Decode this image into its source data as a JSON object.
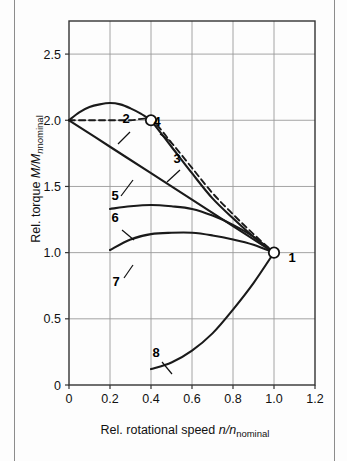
{
  "figure": {
    "background": "#fdfdfd",
    "border_color": "#8c8c8c"
  },
  "axes": {
    "x": {
      "label_prefix": "Rel. rotational speed ",
      "label_symbol": "n/n",
      "label_subscript": "nominal",
      "ticks": [
        "0",
        "0.2",
        "0.4",
        "0.6",
        "0.8",
        "1.0",
        "1.2"
      ],
      "tick_values": [
        0,
        0.2,
        0.4,
        0.6,
        0.8,
        1.0,
        1.2
      ],
      "range": [
        0,
        1.2
      ]
    },
    "y": {
      "label_prefix": "Rel. torque ",
      "label_symbol": "M/M",
      "label_sub_italic": "n",
      "label_subscript": "nominal",
      "ticks": [
        "0",
        "0.5",
        "1.0",
        "1.5",
        "2.0",
        "2.5"
      ],
      "tick_values": [
        0,
        0.5,
        1.0,
        1.5,
        2.0,
        2.5
      ],
      "range": [
        0,
        2.75
      ]
    }
  },
  "curve_labels": [
    {
      "id": "1",
      "text": "1",
      "x": 292,
      "y": 262
    },
    {
      "id": "2",
      "text": "2",
      "x": 126,
      "y": 123
    },
    {
      "id": "3",
      "text": "3",
      "x": 177,
      "y": 163
    },
    {
      "id": "4",
      "text": "4",
      "x": 157,
      "y": 126
    },
    {
      "id": "5",
      "text": "5",
      "x": 115,
      "y": 200
    },
    {
      "id": "6",
      "text": "6",
      "x": 115,
      "y": 222
    },
    {
      "id": "7",
      "text": "7",
      "x": 116,
      "y": 286
    },
    {
      "id": "8",
      "text": "8",
      "x": 156,
      "y": 357
    }
  ],
  "markers": [
    {
      "name": "point-1",
      "x": 1.0,
      "y": 1.0,
      "style": "open-circle"
    },
    {
      "name": "point-4",
      "x": 0.4,
      "y": 2.0,
      "style": "open-circle"
    }
  ],
  "chart_data": {
    "type": "line",
    "title": "",
    "xlabel": "Rel. rotational speed n/n_nominal",
    "ylabel": "Rel. torque M/M_n nominal",
    "xlim": [
      0,
      1.2
    ],
    "ylim": [
      0,
      2.75
    ],
    "grid": true,
    "series": [
      {
        "name": "2",
        "style": "solid",
        "comment": "Starting torque curve peaking ~2.1 then joining point 4",
        "x": [
          0.0,
          0.05,
          0.1,
          0.15,
          0.2,
          0.25,
          0.3,
          0.35,
          0.4
        ],
        "y": [
          2.0,
          2.06,
          2.1,
          2.12,
          2.13,
          2.12,
          2.09,
          2.05,
          2.0
        ]
      },
      {
        "name": "3",
        "style": "dashed",
        "comment": "Dashed: flat at 2.0 to x=0.4 then falling to point 1",
        "x": [
          0.0,
          0.1,
          0.2,
          0.3,
          0.4,
          0.5,
          0.6,
          0.7,
          0.8,
          0.9,
          1.0
        ],
        "y": [
          2.0,
          2.0,
          2.0,
          2.0,
          2.0,
          1.83,
          1.64,
          1.45,
          1.29,
          1.14,
          1.0
        ]
      },
      {
        "name": "4-to-1",
        "style": "solid",
        "comment": "Solid branch from point 4 down to point 1",
        "x": [
          0.4,
          0.5,
          0.6,
          0.7,
          0.8,
          0.9,
          1.0
        ],
        "y": [
          2.0,
          1.8,
          1.6,
          1.41,
          1.26,
          1.12,
          1.0
        ]
      },
      {
        "name": "5",
        "style": "solid",
        "comment": "Straight line from (0,2.0) to point 1",
        "x": [
          0.0,
          0.2,
          0.4,
          0.6,
          0.8,
          1.0
        ],
        "y": [
          2.0,
          1.8,
          1.6,
          1.4,
          1.2,
          1.0
        ]
      },
      {
        "name": "6",
        "style": "solid",
        "comment": "Flat curve starting near 1.33 at x=0.2",
        "x": [
          0.2,
          0.3,
          0.4,
          0.5,
          0.6,
          0.7,
          0.8,
          0.9,
          1.0
        ],
        "y": [
          1.33,
          1.35,
          1.36,
          1.35,
          1.33,
          1.28,
          1.21,
          1.12,
          1.0
        ]
      },
      {
        "name": "7",
        "style": "solid",
        "comment": "Lower flat curve starting near 1.02 at x=0.2",
        "x": [
          0.2,
          0.3,
          0.4,
          0.5,
          0.6,
          0.7,
          0.8,
          0.9,
          1.0
        ],
        "y": [
          1.02,
          1.1,
          1.14,
          1.15,
          1.15,
          1.13,
          1.1,
          1.06,
          1.0
        ]
      },
      {
        "name": "8",
        "style": "solid",
        "comment": "Rising parabolic load curve from (0.4,0.12) to point 1",
        "x": [
          0.4,
          0.5,
          0.6,
          0.7,
          0.8,
          0.9,
          1.0
        ],
        "y": [
          0.12,
          0.17,
          0.26,
          0.39,
          0.57,
          0.77,
          1.0
        ]
      }
    ],
    "annotations": [
      "1",
      "2",
      "3",
      "4",
      "5",
      "6",
      "7",
      "8"
    ]
  }
}
